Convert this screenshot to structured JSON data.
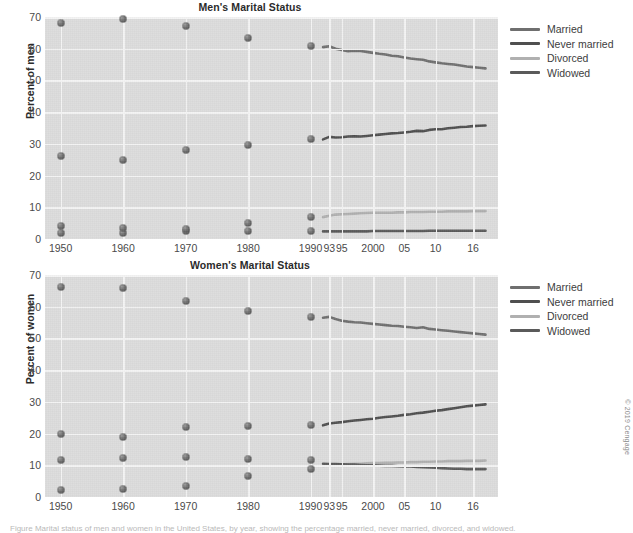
{
  "credit": "© 2019 Cengage",
  "caption": "Figure  Marital status of men and women in the United States, by year, showing the percentage married, never married, divorced, and widowed.",
  "legend": {
    "items": [
      {
        "label": "Married",
        "color": "#6f6f6f"
      },
      {
        "label": "Never married",
        "color": "#4f4f4f"
      },
      {
        "label": "Divorced",
        "color": "#b0b0b0"
      },
      {
        "label": "Widowed",
        "color": "#5a5a5a"
      }
    ]
  },
  "chart_data": [
    {
      "id": "men",
      "type": "scatter",
      "title": "Men's Marital Status",
      "xlabel": "",
      "ylabel": "Percent of men",
      "ylim": [
        0,
        70
      ],
      "yticks": [
        0,
        10,
        20,
        30,
        40,
        50,
        60,
        70
      ],
      "xticks": [
        "1950",
        "1960",
        "1970",
        "1980",
        "1990",
        "93",
        "95",
        "2000",
        "05",
        "10",
        "16"
      ],
      "xtick_values": [
        1950,
        1960,
        1970,
        1980,
        1990,
        1993,
        1995,
        2000,
        2005,
        2010,
        2016
      ],
      "grid": true,
      "legend_position": "right",
      "decade_points": {
        "x": [
          1950,
          1960,
          1970,
          1980,
          1990
        ],
        "Married": [
          68.0,
          69.3,
          67.2,
          63.5,
          61.0
        ],
        "Never married": [
          26.2,
          25.0,
          28.1,
          29.6,
          31.6
        ],
        "Divorced": [
          2.0,
          1.8,
          2.5,
          5.2,
          6.8
        ],
        "Widowed": [
          4.2,
          3.6,
          3.3,
          2.4,
          2.4
        ]
      },
      "series": [
        {
          "name": "Married",
          "color": "#6f6f6f",
          "x": [
            1992,
            1993,
            1994,
            1995,
            1996,
            1997,
            1998,
            1999,
            2000,
            2001,
            2002,
            2003,
            2004,
            2005,
            2006,
            2007,
            2008,
            2009,
            2010,
            2011,
            2012,
            2013,
            2014,
            2015,
            2016,
            2017,
            2018
          ],
          "values": [
            60.5,
            60.8,
            60.0,
            59.6,
            59.2,
            59.4,
            59.3,
            59.0,
            58.7,
            58.4,
            58.2,
            57.8,
            57.6,
            57.2,
            56.9,
            56.7,
            56.5,
            56.0,
            55.7,
            55.4,
            55.2,
            55.0,
            54.7,
            54.4,
            54.2,
            54.0,
            53.8
          ]
        },
        {
          "name": "Never married",
          "color": "#4f4f4f",
          "x": [
            1992,
            1993,
            1994,
            1995,
            1996,
            1997,
            1998,
            1999,
            2000,
            2001,
            2002,
            2003,
            2004,
            2005,
            2006,
            2007,
            2008,
            2009,
            2010,
            2011,
            2012,
            2013,
            2014,
            2015,
            2016,
            2017,
            2018
          ],
          "values": [
            31.4,
            32.2,
            32.0,
            32.1,
            32.3,
            32.4,
            32.3,
            32.5,
            32.7,
            32.9,
            33.1,
            33.3,
            33.4,
            33.6,
            33.8,
            34.1,
            34.0,
            34.4,
            34.6,
            34.6,
            34.9,
            35.1,
            35.3,
            35.4,
            35.6,
            35.7,
            35.8
          ]
        },
        {
          "name": "Divorced",
          "color": "#b0b0b0",
          "x": [
            1992,
            1993,
            1994,
            1995,
            1996,
            1997,
            1998,
            1999,
            2000,
            2001,
            2002,
            2003,
            2004,
            2005,
            2006,
            2007,
            2008,
            2009,
            2010,
            2011,
            2012,
            2013,
            2014,
            2015,
            2016,
            2017,
            2018
          ],
          "values": [
            6.9,
            7.3,
            7.7,
            7.8,
            7.9,
            8.0,
            8.1,
            8.2,
            8.3,
            8.3,
            8.3,
            8.3,
            8.4,
            8.4,
            8.5,
            8.5,
            8.5,
            8.6,
            8.6,
            8.6,
            8.7,
            8.7,
            8.7,
            8.7,
            8.8,
            8.8,
            8.8
          ]
        },
        {
          "name": "Widowed",
          "color": "#5a5a5a",
          "x": [
            1992,
            1993,
            1994,
            1995,
            1996,
            1997,
            1998,
            1999,
            2000,
            2001,
            2002,
            2003,
            2004,
            2005,
            2006,
            2007,
            2008,
            2009,
            2010,
            2011,
            2012,
            2013,
            2014,
            2015,
            2016,
            2017,
            2018
          ],
          "values": [
            2.4,
            2.4,
            2.4,
            2.4,
            2.4,
            2.4,
            2.4,
            2.4,
            2.5,
            2.5,
            2.5,
            2.5,
            2.5,
            2.5,
            2.5,
            2.5,
            2.5,
            2.6,
            2.6,
            2.6,
            2.6,
            2.6,
            2.6,
            2.6,
            2.6,
            2.6,
            2.6
          ]
        }
      ]
    },
    {
      "id": "women",
      "type": "scatter",
      "title": "Women's Marital Status",
      "xlabel": "",
      "ylabel": "Percent of women",
      "ylim": [
        0,
        70
      ],
      "yticks": [
        0,
        10,
        20,
        30,
        40,
        50,
        60,
        70
      ],
      "xticks": [
        "1950",
        "1960",
        "1970",
        "1980",
        "1990",
        "93",
        "95",
        "2000",
        "05",
        "10",
        "16"
      ],
      "xtick_values": [
        1950,
        1960,
        1970,
        1980,
        1990,
        1993,
        1995,
        2000,
        2005,
        2010,
        2016
      ],
      "grid": true,
      "legend_position": "right",
      "decade_points": {
        "x": [
          1950,
          1960,
          1970,
          1980,
          1990
        ],
        "Married": [
          66.1,
          66.0,
          61.9,
          58.7,
          56.9
        ],
        "Never married": [
          20.0,
          19.0,
          22.1,
          22.5,
          22.8
        ],
        "Divorced": [
          2.2,
          2.4,
          3.5,
          6.6,
          8.9
        ],
        "Widowed": [
          11.8,
          12.3,
          12.5,
          12.1,
          11.7
        ]
      },
      "series": [
        {
          "name": "Married",
          "color": "#6f6f6f",
          "x": [
            1992,
            1993,
            1994,
            1995,
            1996,
            1997,
            1998,
            1999,
            2000,
            2001,
            2002,
            2003,
            2004,
            2005,
            2006,
            2007,
            2008,
            2009,
            2010,
            2011,
            2012,
            2013,
            2014,
            2015,
            2016,
            2017,
            2018
          ],
          "values": [
            56.5,
            56.8,
            56.1,
            55.6,
            55.3,
            55.1,
            55.0,
            54.8,
            54.6,
            54.4,
            54.2,
            54.0,
            53.9,
            53.7,
            53.5,
            53.3,
            53.5,
            53.0,
            52.8,
            52.6,
            52.4,
            52.2,
            52.0,
            51.8,
            51.6,
            51.4,
            51.2
          ]
        },
        {
          "name": "Never married",
          "color": "#4f4f4f",
          "x": [
            1992,
            1993,
            1994,
            1995,
            1996,
            1997,
            1998,
            1999,
            2000,
            2001,
            2002,
            2003,
            2004,
            2005,
            2006,
            2007,
            2008,
            2009,
            2010,
            2011,
            2012,
            2013,
            2014,
            2015,
            2016,
            2017,
            2018
          ],
          "values": [
            22.6,
            23.2,
            23.4,
            23.6,
            23.9,
            24.1,
            24.3,
            24.5,
            24.7,
            25.0,
            25.2,
            25.4,
            25.6,
            25.9,
            26.1,
            26.4,
            26.6,
            26.9,
            27.2,
            27.4,
            27.7,
            28.0,
            28.3,
            28.6,
            28.8,
            29.0,
            29.2
          ]
        },
        {
          "name": "Divorced",
          "color": "#b0b0b0",
          "x": [
            1992,
            1993,
            1994,
            1995,
            1996,
            1997,
            1998,
            1999,
            2000,
            2001,
            2002,
            2003,
            2004,
            2005,
            2006,
            2007,
            2008,
            2009,
            2010,
            2011,
            2012,
            2013,
            2014,
            2015,
            2016,
            2017,
            2018
          ],
          "values": [
            9.8,
            10.1,
            10.2,
            10.3,
            10.4,
            10.5,
            10.5,
            10.6,
            10.7,
            10.7,
            10.8,
            10.8,
            10.9,
            10.9,
            11.0,
            11.0,
            11.1,
            11.1,
            11.2,
            11.2,
            11.3,
            11.3,
            11.3,
            11.4,
            11.4,
            11.4,
            11.5
          ]
        },
        {
          "name": "Widowed",
          "color": "#5a5a5a",
          "x": [
            1992,
            1993,
            1994,
            1995,
            1996,
            1997,
            1998,
            1999,
            2000,
            2001,
            2002,
            2003,
            2004,
            2005,
            2006,
            2007,
            2008,
            2009,
            2010,
            2011,
            2012,
            2013,
            2014,
            2015,
            2016,
            2017,
            2018
          ],
          "values": [
            10.5,
            10.4,
            10.4,
            10.3,
            10.2,
            10.2,
            10.1,
            10.0,
            10.0,
            9.9,
            9.8,
            9.8,
            9.7,
            9.6,
            9.6,
            9.5,
            9.4,
            9.3,
            9.2,
            9.1,
            9.0,
            8.9,
            8.9,
            8.8,
            8.8,
            8.8,
            8.8
          ]
        }
      ]
    }
  ]
}
